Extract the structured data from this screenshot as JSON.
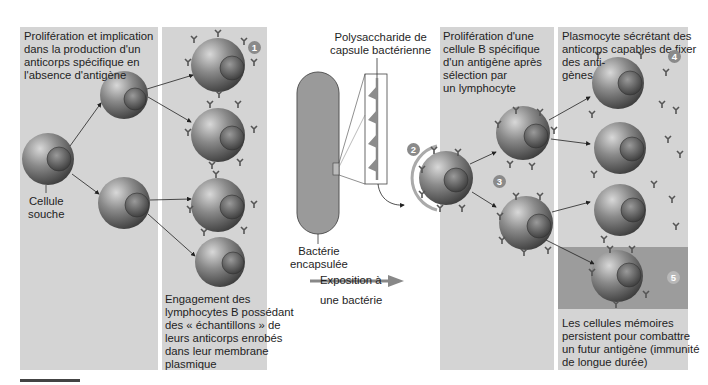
{
  "left_panel": {
    "title": "Prolifération et implication\ndans la production d'un\nanticorps spécifique en\nl'absence d'antigène",
    "stem_cell_label": "Cellule\nsouche",
    "marker": "1",
    "caption": "Engagement des\nlymphocytes B possédant\ndes « échantillons » de\nleurs anticorps enrobés\ndans leur membrane\nplasmique"
  },
  "middle": {
    "capsule_label": "Polysaccharide de\ncapsule bactérienne",
    "bacteria_label": "Bactérie\nencapsulée",
    "exposure_label": "Exposition à\nune bactérie",
    "marker": "2"
  },
  "right_panel": {
    "title": "Prolifération d'une\ncellule B spécifique\nd'un antigène après\nsélection par\nun lymphocyte",
    "marker_3": "3",
    "plasma_title": "Plasmocyte sécrétant des\nanticorps capables de fixer\ndes anti-\ngènes",
    "marker_4": "4",
    "marker_5": "5",
    "memory_caption": "Les cellules mémoires\npersistent pour combattre\nun futur antigène (immunité\nde longue durée)"
  },
  "colors": {
    "panel_bg": "#d4d4d4",
    "memory_bg": "#9c9c9c",
    "cell_dark": "#4a4a4a",
    "cell_light": "#bdbdbd",
    "marker_bg": "#8a8a8a"
  }
}
